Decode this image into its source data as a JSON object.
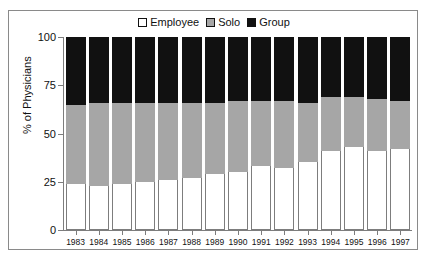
{
  "chart_data": {
    "type": "bar",
    "subtype": "stacked-bar-100",
    "title": "",
    "xlabel": "",
    "ylabel": "% of Physicians",
    "ylim": [
      0,
      100
    ],
    "yticks": [
      0,
      25,
      50,
      75,
      100
    ],
    "ytick_labels": [
      "0",
      "25",
      "50",
      "75",
      "100"
    ],
    "grid": false,
    "legend_position": "top-center",
    "categories": [
      "1983",
      "1984",
      "1985",
      "1986",
      "1987",
      "1988",
      "1989",
      "1990",
      "1991",
      "1992",
      "1993",
      "1994",
      "1995",
      "1996",
      "1997"
    ],
    "series": [
      {
        "name": "Employee",
        "color": "#ffffff",
        "values": [
          24,
          23,
          24,
          25,
          26,
          27,
          29,
          30,
          33,
          32,
          35,
          41,
          43,
          41,
          42
        ]
      },
      {
        "name": "Solo",
        "color": "#a6a6a6",
        "values": [
          41,
          43,
          42,
          41,
          40,
          39,
          37,
          37,
          34,
          35,
          31,
          28,
          26,
          27,
          25
        ]
      },
      {
        "name": "Group",
        "color": "#111111",
        "values": [
          35,
          34,
          34,
          34,
          34,
          34,
          34,
          33,
          33,
          33,
          34,
          31,
          31,
          32,
          33
        ]
      }
    ]
  },
  "legend": {
    "items": [
      {
        "label": "Employee",
        "swatch": "swatch-white"
      },
      {
        "label": "Solo",
        "swatch": "swatch-gray"
      },
      {
        "label": "Group",
        "swatch": "swatch-black"
      }
    ]
  },
  "axis": {
    "y_title": "% of Physicians"
  },
  "colors": {
    "employee": "#ffffff",
    "solo": "#a6a6a6",
    "group": "#111111",
    "axis": "#7d7d7d",
    "border": "#8a8a8a",
    "text": "#111111"
  }
}
